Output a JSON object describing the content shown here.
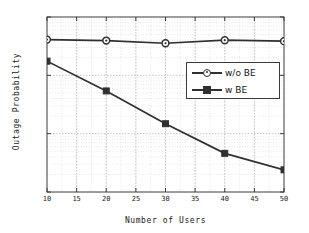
{
  "chart_data": {
    "type": "line",
    "title": "",
    "xlabel": "Number of Users",
    "ylabel": "Outage Probability",
    "xlim": [
      10,
      50
    ],
    "ylim": [
      0.001,
      1
    ],
    "yscale": "log",
    "xscale": "linear",
    "grid": true,
    "minor_grid": true,
    "legend_position": "center-right",
    "x": [
      10,
      20,
      30,
      40,
      50
    ],
    "xticks": [
      10,
      15,
      20,
      25,
      30,
      35,
      40,
      45,
      50
    ],
    "xtick_labels": [
      "10",
      "15",
      "20",
      "25",
      "30",
      "35",
      "40",
      "45",
      "50"
    ],
    "yticks": [
      1,
      0.1,
      0.01,
      0.001
    ],
    "ytick_labels": [
      "10^0",
      "10^-1",
      "10^-2",
      "10^-3"
    ],
    "ytick_mantissa": [
      "10",
      "10",
      "10",
      "10"
    ],
    "ytick_exponent": [
      "0",
      "-1",
      "-2",
      "-3"
    ],
    "series": [
      {
        "name": "w/o BE",
        "marker": "circle",
        "color": "#303030",
        "values": [
          0.41,
          0.395,
          0.355,
          0.4,
          0.385
        ]
      },
      {
        "name": "w BE",
        "marker": "square",
        "color": "#303030",
        "values": [
          0.175,
          0.054,
          0.0148,
          0.0046,
          0.0024
        ]
      }
    ]
  },
  "legend": {
    "items": [
      {
        "label": "w/o BE",
        "marker": "circle"
      },
      {
        "label": "w BE",
        "marker": "square"
      }
    ]
  },
  "colors": {
    "line": "#303030",
    "axis": "#3a3a3a",
    "grid_major": "#b9b9b9",
    "grid_minor": "#d8d8d8",
    "background": "#ffffff",
    "text": "#202020"
  }
}
